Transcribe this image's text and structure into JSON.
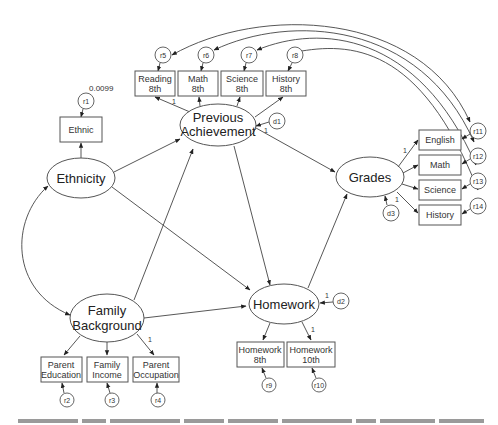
{
  "diagram": {
    "type": "structural-equation-model",
    "latent_variables": {
      "ethnicity": "Ethnicity",
      "family_background": [
        "Family",
        "Background"
      ],
      "previous_achievement": [
        "Previous",
        "Achievement"
      ],
      "homework": "Homework",
      "grades": "Grades"
    },
    "observed_variables": {
      "ethnic": "Ethnic",
      "reading8": [
        "Reading",
        "8th"
      ],
      "math8": [
        "Math",
        "8th"
      ],
      "science8": [
        "Science",
        "8th"
      ],
      "history8": [
        "History",
        "8th"
      ],
      "parent_education": [
        "Parent",
        "Education"
      ],
      "family_income": [
        "Family",
        "Income"
      ],
      "parent_occupation": [
        "Parent",
        "Occupation"
      ],
      "homework8": [
        "Homework",
        "8th"
      ],
      "homework10": [
        "Homework",
        "10th"
      ],
      "english": "English",
      "math": "Math",
      "science": "Science",
      "history": "History"
    },
    "residuals": {
      "r1": "r1",
      "r2": "r2",
      "r3": "r3",
      "r4": "r4",
      "r5": "r5",
      "r6": "r6",
      "r7": "r7",
      "r8": "r8",
      "r9": "r9",
      "r10": "r10",
      "r11": "r11",
      "r12": "r12",
      "r13": "r13",
      "r14": "r14"
    },
    "disturbances": {
      "d1": "d1",
      "d2": "d2",
      "d3": "d3"
    },
    "annotations": {
      "r1_variance": "0.0099",
      "fixed_path": "1"
    },
    "paths": [
      {
        "from": "Ethnicity",
        "to": "Previous Achievement"
      },
      {
        "from": "Ethnicity",
        "to": "Homework"
      },
      {
        "from": "Family Background",
        "to": "Previous Achievement"
      },
      {
        "from": "Family Background",
        "to": "Homework"
      },
      {
        "from": "Previous Achievement",
        "to": "Homework"
      },
      {
        "from": "Previous Achievement",
        "to": "Grades"
      },
      {
        "from": "Homework",
        "to": "Grades"
      },
      {
        "from": "Ethnicity",
        "to": "Family Background",
        "type": "correlation"
      }
    ],
    "correlated_residuals": [
      {
        "a": "r5",
        "b": "r11"
      },
      {
        "a": "r6",
        "b": "r12"
      },
      {
        "a": "r7",
        "b": "r13"
      },
      {
        "a": "r8",
        "b": "r14"
      }
    ]
  },
  "caption": {
    "visible": "cropped-illegible"
  }
}
